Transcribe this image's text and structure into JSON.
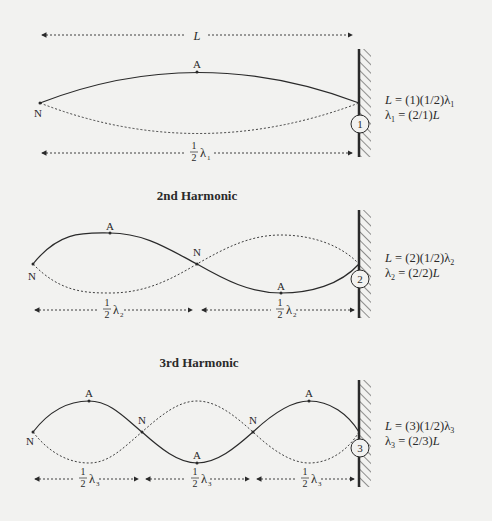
{
  "colors": {
    "background": "#f2f2f0",
    "ink": "#2a2a2a"
  },
  "length_label": "L",
  "harmonics": [
    {
      "title": "",
      "number": "1",
      "node_labels": [
        "N"
      ],
      "antinode_labels": [
        "A"
      ],
      "segment_label": {
        "num": "1",
        "den": "2",
        "sym": "λ",
        "sub": "1"
      },
      "equations": {
        "line1": {
          "pre": "L",
          "mid": " = (1)(1/2)λ",
          "sub": "1"
        },
        "line2": {
          "pre": "λ",
          "sub": "1",
          "post": " = (2/1)",
          "end": "L"
        }
      }
    },
    {
      "title": "2nd Harmonic",
      "number": "2",
      "node_labels": [
        "N",
        "N"
      ],
      "antinode_labels": [
        "A",
        "A"
      ],
      "segment_label": {
        "num": "1",
        "den": "2",
        "sym": "λ",
        "sub": "2"
      },
      "equations": {
        "line1": {
          "pre": "L",
          "mid": " = (2)(1/2)λ",
          "sub": "2"
        },
        "line2": {
          "pre": "λ",
          "sub": "2",
          "post": " = (2/2)",
          "end": "L"
        }
      }
    },
    {
      "title": "3rd Harmonic",
      "number": "3",
      "node_labels": [
        "N",
        "N",
        "N"
      ],
      "antinode_labels": [
        "A",
        "A",
        "A"
      ],
      "segment_label": {
        "num": "1",
        "den": "2",
        "sym": "λ",
        "sub": "3"
      },
      "equations": {
        "line1": {
          "pre": "L",
          "mid": " = (3)(1/2)λ",
          "sub": "3"
        },
        "line2": {
          "pre": "λ",
          "sub": "3",
          "post": " = (2/3)",
          "end": "L"
        }
      }
    }
  ]
}
